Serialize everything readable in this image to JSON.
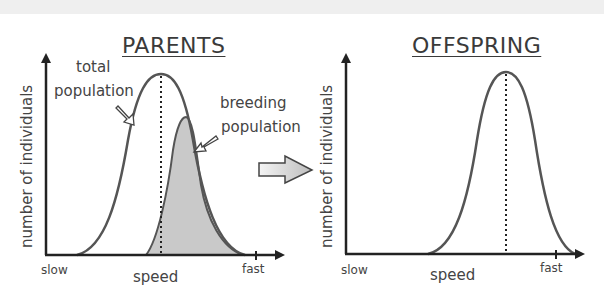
{
  "diagram": {
    "parents": {
      "title": "PARENTS",
      "y_axis_label": "number of individuals",
      "x_axis_label": "speed",
      "x_min_label": "slow",
      "x_max_label": "fast",
      "annotations": {
        "total_line1": "total",
        "total_line2": "population",
        "breeding_line1": "breeding",
        "breeding_line2": "population"
      }
    },
    "offspring": {
      "title": "OFFSPRING",
      "y_axis_label": "number of individuals",
      "x_axis_label": "speed",
      "x_min_label": "slow",
      "x_max_label": "fast"
    },
    "colors": {
      "curve": "#555555",
      "axis": "#222222",
      "shade": "#c8c8c8",
      "arrow_fill": "#cfcfcf"
    }
  }
}
